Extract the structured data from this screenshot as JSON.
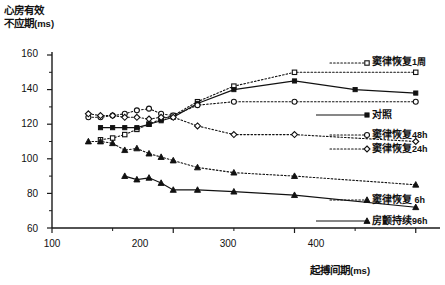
{
  "axes": {
    "ylabel_line1": "心房有效",
    "ylabel_line2": "不应期",
    "ylabel_unit": "(ms)",
    "xlabel_text": "起搏间期",
    "xlabel_unit": "(ms)",
    "y_ticks": [
      "160",
      "140",
      "120",
      "100",
      "80",
      "60"
    ],
    "x_ticks": [
      "100",
      "200",
      "300",
      "400"
    ]
  },
  "legend": {
    "items": [
      {
        "name": "窦律恢复",
        "suffix": "1周"
      },
      {
        "name": "对照",
        "suffix": ""
      },
      {
        "name": "窦律恢复",
        "suffix": "48h"
      },
      {
        "name": "窦律恢复",
        "suffix": "24h"
      },
      {
        "name": "窦律恢复",
        "suffix": " 6h"
      },
      {
        "name": "房颤持续",
        "suffix": "96h"
      }
    ]
  },
  "chart_data": {
    "type": "line",
    "title": "",
    "xlabel": "起搏间期 (ms)",
    "ylabel": "心房有效不应期 (ms)",
    "xlim": [
      100,
      420
    ],
    "ylim": [
      60,
      160
    ],
    "x_ticks": [
      100,
      200,
      300,
      400
    ],
    "x_minor_ticks": [
      150,
      250,
      350
    ],
    "y_ticks": [
      60,
      80,
      100,
      120,
      140,
      160
    ],
    "y_minor_ticks": [
      70,
      90,
      110,
      130,
      150
    ],
    "grid": false,
    "legend_position": "right",
    "series": [
      {
        "name": "窦律恢复1周",
        "marker": "open-square",
        "line_style": "dotted",
        "x": [
          140,
          150,
          160,
          170,
          180,
          190,
          200,
          220,
          250,
          300,
          400
        ],
        "y": [
          111,
          112,
          114,
          117,
          120,
          123,
          125,
          133,
          142,
          150,
          150
        ]
      },
      {
        "name": "对照",
        "marker": "filled-square",
        "line_style": "solid",
        "x": [
          140,
          150,
          160,
          170,
          180,
          190,
          200,
          220,
          250,
          300,
          350,
          400
        ],
        "y": [
          118,
          118,
          118,
          118,
          120,
          122,
          124,
          132,
          140,
          145,
          140,
          138
        ]
      },
      {
        "name": "窦律恢复48h",
        "marker": "open-circle",
        "line_style": "dotted",
        "x": [
          130,
          140,
          150,
          160,
          170,
          180,
          190,
          200,
          220,
          250,
          300,
          400
        ],
        "y": [
          124,
          124,
          125,
          126,
          128,
          129,
          126,
          125,
          131,
          133,
          133,
          133
        ]
      },
      {
        "name": "窦律恢复24h",
        "marker": "open-diamond",
        "line_style": "dotted",
        "x": [
          130,
          140,
          150,
          160,
          170,
          180,
          190,
          200,
          220,
          250,
          300,
          400
        ],
        "y": [
          126,
          125,
          125,
          124,
          124,
          123,
          124,
          124,
          119,
          114,
          114,
          110
        ]
      },
      {
        "name": "窦律恢复 6h",
        "marker": "filled-triangle",
        "line_style": "dotted",
        "x": [
          130,
          140,
          150,
          160,
          170,
          180,
          190,
          200,
          220,
          250,
          300,
          400
        ],
        "y": [
          110,
          110,
          109,
          105,
          106,
          103,
          101,
          99,
          95,
          92,
          90,
          85
        ]
      },
      {
        "name": "房颤持续96h",
        "marker": "filled-triangle",
        "line_style": "solid",
        "x": [
          160,
          170,
          180,
          190,
          200,
          220,
          250,
          300,
          400
        ],
        "y": [
          90,
          88,
          89,
          86,
          82,
          82,
          81,
          79,
          72
        ]
      }
    ]
  }
}
